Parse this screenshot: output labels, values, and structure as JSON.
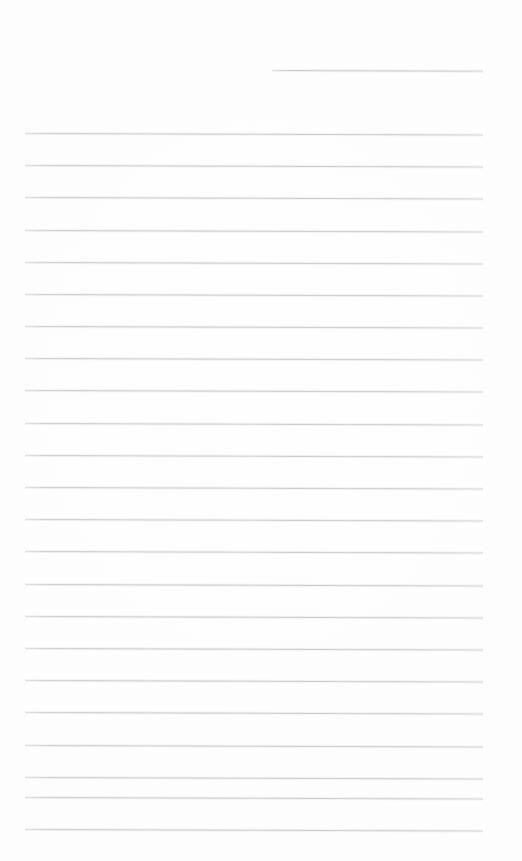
{
  "page": {
    "kind": "ruled-notebook-paper-scan",
    "width": 522,
    "height": 861,
    "background_color": "#fefeff",
    "text_content": "",
    "has_handwriting": false,
    "has_printed_text": false,
    "note": "Blank ruled writing paper — no text present"
  },
  "rules": {
    "color": "#c9cbd0",
    "thickness_px": 1,
    "spacing_px": 32.2,
    "left_margin_x": 25,
    "right_margin_x": 483,
    "count_full_width": 23,
    "count_partial": 1,
    "slope_deg": 0.18,
    "partial_rule": {
      "y": 70,
      "x_start": 272,
      "x_end": 483,
      "label": "short-rule"
    },
    "full_rule_y": [
      133,
      165,
      197,
      230,
      262,
      294,
      326,
      358,
      390,
      423,
      455,
      487,
      519,
      551,
      584,
      616,
      648,
      680,
      712,
      745,
      777,
      797,
      829
    ]
  }
}
